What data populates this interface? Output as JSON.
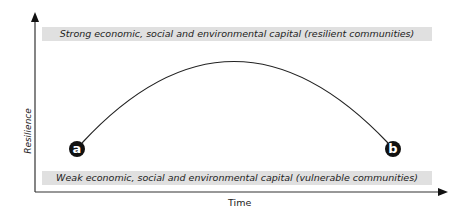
{
  "diagram": {
    "top_band": "Strong economic, social and environmental capital (resilient communities)",
    "bottom_band": "Weak economic, social and environmental capital (vulnerable communities)",
    "y_axis_label": "Resilience",
    "x_axis_label": "Time",
    "points": [
      {
        "label": "a"
      },
      {
        "label": "b"
      }
    ]
  }
}
